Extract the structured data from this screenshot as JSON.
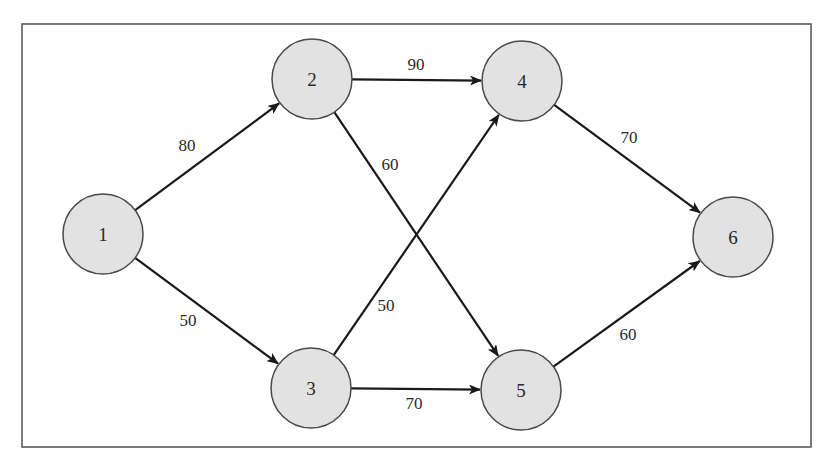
{
  "diagram": {
    "type": "directed-weighted-network",
    "frame": {
      "x": 22,
      "y": 24,
      "width": 789,
      "height": 423
    },
    "colors": {
      "node_fill": "#e2e2e2",
      "node_stroke": "#4a4a4a",
      "edge": "#1a1a1a",
      "frame": "#5a5a5a",
      "text": "#2a2a2a"
    },
    "node_radius": 40,
    "nodes": [
      {
        "id": "1",
        "label": "1",
        "cx": 103,
        "cy": 234
      },
      {
        "id": "2",
        "label": "2",
        "cx": 312,
        "cy": 79
      },
      {
        "id": "3",
        "label": "3",
        "cx": 311,
        "cy": 388
      },
      {
        "id": "4",
        "label": "4",
        "cx": 522,
        "cy": 81
      },
      {
        "id": "5",
        "label": "5",
        "cx": 521,
        "cy": 390
      },
      {
        "id": "6",
        "label": "6",
        "cx": 733,
        "cy": 237
      }
    ],
    "edges": [
      {
        "from": "1",
        "to": "2",
        "weight": "80",
        "label_x": 187,
        "label_y": 145
      },
      {
        "from": "1",
        "to": "3",
        "weight": "50",
        "label_x": 188,
        "label_y": 320
      },
      {
        "from": "2",
        "to": "4",
        "weight": "90",
        "label_x": 416,
        "label_y": 64
      },
      {
        "from": "2",
        "to": "5",
        "weight": "60",
        "label_x": 390,
        "label_y": 164
      },
      {
        "from": "3",
        "to": "4",
        "weight": "50",
        "label_x": 386,
        "label_y": 305
      },
      {
        "from": "3",
        "to": "5",
        "weight": "70",
        "label_x": 414,
        "label_y": 403
      },
      {
        "from": "4",
        "to": "6",
        "weight": "70",
        "label_x": 629,
        "label_y": 137
      },
      {
        "from": "5",
        "to": "6",
        "weight": "60",
        "label_x": 628,
        "label_y": 334
      }
    ]
  }
}
